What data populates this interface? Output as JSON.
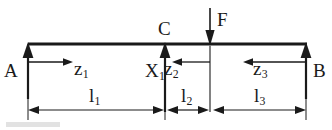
{
  "figure": {
    "type": "statics-beam-diagram",
    "colors": {
      "line": "#1a1a1a",
      "background": "#ffffff",
      "text": "#1a1a1a"
    },
    "beam": {
      "name": "horizontal-beam",
      "x_start": 28,
      "x_end": 307,
      "y": 44
    },
    "supports": [
      {
        "id": "A",
        "label": "A",
        "x": 28,
        "direction": "up"
      },
      {
        "id": "C",
        "label": "C",
        "x": 165,
        "direction": "up"
      },
      {
        "id": "B",
        "label": "B",
        "x": 306,
        "direction": "up"
      }
    ],
    "loads": [
      {
        "id": "F",
        "label": "F",
        "x": 210,
        "direction": "down"
      }
    ],
    "coordinates": [
      {
        "id": "z1",
        "label": "z",
        "sub": "1",
        "direction": "right",
        "x_from": 28,
        "x_to": 72,
        "y": 68
      },
      {
        "id": "z2",
        "label": "z",
        "sub": "2",
        "direction": "left",
        "x_from": 210,
        "x_to": 166,
        "y": 68
      },
      {
        "id": "z3",
        "label": "z",
        "sub": "3",
        "direction": "left",
        "x_from": 305,
        "x_to": 238,
        "y": 68
      }
    ],
    "redundant": {
      "id": "X1",
      "label": "X",
      "sub": "1",
      "x": 147,
      "y": 60
    },
    "dimensions": [
      {
        "id": "l1",
        "label": "l",
        "sub": "1",
        "x_from": 28,
        "x_to": 163,
        "y": 110
      },
      {
        "id": "l2",
        "label": "l",
        "sub": "2",
        "x_from": 168,
        "x_to": 207,
        "y": 110
      },
      {
        "id": "l3",
        "label": "l",
        "sub": "3",
        "x_from": 214,
        "x_to": 305,
        "y": 110
      }
    ],
    "labels": {
      "support_a": "A",
      "support_b": "B",
      "support_c": "C",
      "force_f": "F",
      "coord_z1_base": "z",
      "coord_z1_sub": "1",
      "coord_z2_base": "z",
      "coord_z2_sub": "2",
      "coord_z3_base": "z",
      "coord_z3_sub": "3",
      "redundant_base": "X",
      "redundant_sub": "1",
      "dim_l1_base": "l",
      "dim_l1_sub": "1",
      "dim_l2_base": "l",
      "dim_l2_sub": "2",
      "dim_l3_base": "l",
      "dim_l3_sub": "3"
    }
  }
}
